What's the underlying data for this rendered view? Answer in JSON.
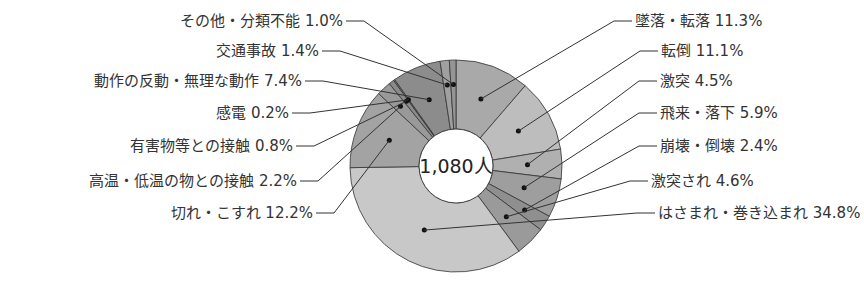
{
  "chart_data": {
    "type": "pie",
    "variant": "donut",
    "title": "",
    "center_label": "1,080人",
    "total": 1080,
    "unit": "%",
    "categories": [
      "墜落・転落",
      "転倒",
      "激突",
      "飛来・落下",
      "崩壊・倒壊",
      "激突され",
      "はさまれ・巻き込まれ",
      "切れ・こすれ",
      "高温・低温の物との接触",
      "有害物等との接触",
      "感電",
      "動作の反動・無理な動作",
      "交通事故",
      "その他・分類不能"
    ],
    "values": [
      11.3,
      11.1,
      4.5,
      5.9,
      2.4,
      4.6,
      34.8,
      12.2,
      2.2,
      0.8,
      0.2,
      7.4,
      1.4,
      1.0
    ],
    "labels": [
      "墜落・転落 11.3%",
      "転倒 11.1%",
      "激突 4.5%",
      "飛来・落下 5.9%",
      "崩壊・倒壊 2.4%",
      "激突され 4.6%",
      "はさまれ・巻き込まれ 34.8%",
      "切れ・こすれ 12.2%",
      "高温・低温の物との接触 2.2%",
      "有害物等との接触 0.8%",
      "感電 0.2%",
      "動作の反動・無理な動作 7.4%",
      "交通事故 1.4%",
      "その他・分類不能 1.0%"
    ],
    "colors": [
      "#a9a9a9",
      "#bdbdbd",
      "#b0b0b0",
      "#9e9e9e",
      "#8f8f8f",
      "#9a9a9a",
      "#c8c8c8",
      "#a3a3a3",
      "#999999",
      "#8a8a8a",
      "#7d7d7d",
      "#8c8c8c",
      "#a0a0a0",
      "#959595"
    ],
    "start_angle_deg": 0,
    "direction": "clockwise"
  }
}
